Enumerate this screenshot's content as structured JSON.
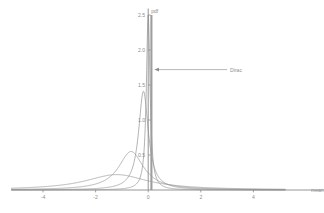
{
  "chart_data": {
    "type": "line",
    "title": "",
    "xlabel": "mean",
    "ylabel": "pdf",
    "xlim": [
      -5.2,
      5.2
    ],
    "ylim": [
      0,
      2.55
    ],
    "xticks": [
      -4,
      -2,
      0,
      2,
      4
    ],
    "xtick_labels": [
      "-4",
      "-2",
      "0",
      "2",
      "4"
    ],
    "yticks": [
      0.5,
      1.0,
      1.5,
      2.0,
      2.5
    ],
    "ytick_labels": [
      "0.5",
      "1.0",
      "1.5",
      "2.0",
      "2.5"
    ],
    "grid": false,
    "legend": "none",
    "series": [
      {
        "name": "wide",
        "kind": "cauchy",
        "location": -1.2,
        "scale": 1.45,
        "peak": 0.22,
        "color": "#9a9a9a"
      },
      {
        "name": "medium",
        "kind": "cauchy",
        "location": -0.65,
        "scale": 0.58,
        "peak": 0.55,
        "color": "#9a9a9a"
      },
      {
        "name": "narrow",
        "kind": "cauchy",
        "location": -0.18,
        "scale": 0.225,
        "peak": 1.41,
        "color": "#9a9a9a"
      },
      {
        "name": "very-narrow",
        "kind": "cauchy",
        "location": 0.0,
        "scale": 0.085,
        "peak": 2.5,
        "color": "#9a9a9a"
      }
    ],
    "spike": {
      "name": "Dirac",
      "x": 0,
      "height": 2.5,
      "color": "#9e9e9e"
    },
    "annotations": [
      {
        "text": "Dirac",
        "x": 3.0,
        "y": 1.72,
        "arrow_to_x": 0.12,
        "arrow_to_y": 1.72
      }
    ],
    "colors": {
      "axis": "#8a8a8a",
      "text": "#8d8d8d",
      "curve": "#9a9a9a",
      "background": "#ffffff"
    }
  }
}
